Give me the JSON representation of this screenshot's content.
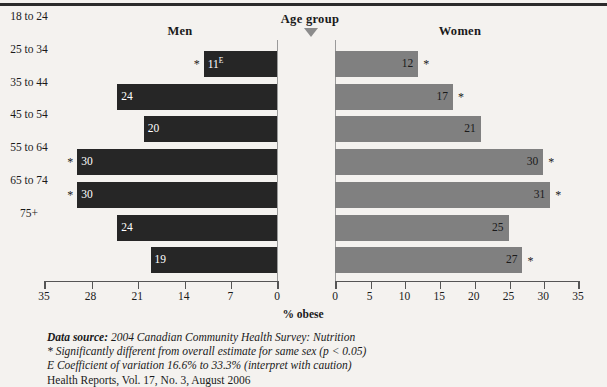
{
  "headers": {
    "men": "Men",
    "women": "Women",
    "age_group": "Age group",
    "arrow_icon": "triangle-down-icon"
  },
  "axis": {
    "title": "% obese",
    "men_ticks": [
      "35",
      "28",
      "21",
      "14",
      "7",
      "0"
    ],
    "women_ticks": [
      "0",
      "5",
      "10",
      "15",
      "20",
      "25",
      "30",
      "35"
    ]
  },
  "notes": [
    {
      "lead": "Data source:",
      "text": " 2004 Canadian Community Health Survey: Nutrition",
      "italic": true
    },
    {
      "lead": "",
      "text": "* Significantly different from overall estimate for same sex (p < 0.05)",
      "italic": true
    },
    {
      "lead": "",
      "text": "E Coefficient of variation 16.6% to 33.3% (interpret with caution)",
      "italic": true
    },
    {
      "lead": "",
      "text": "Health Reports, Vol. 17, No. 3, August 2006",
      "italic": false
    }
  ],
  "colors": {
    "men_bar": "#262626",
    "women_bar": "#808080",
    "background": "#f4f2ef",
    "rule": "#2b2b2b",
    "axis": "#555555"
  },
  "chart_data": {
    "type": "bar",
    "subtype": "back-to-back horizontal bar (population pyramid style)",
    "xlabel": "% obese",
    "ylabel": "Age group",
    "categories": [
      "18 to 24",
      "25 to 34",
      "35 to 44",
      "45 to 54",
      "55 to 64",
      "65 to 74",
      "75+"
    ],
    "men_xlim": [
      35,
      0
    ],
    "women_xlim": [
      0,
      35
    ],
    "grid": false,
    "legend": "none",
    "series": [
      {
        "name": "Men",
        "direction": "left",
        "color": "#262626",
        "values": [
          11,
          24,
          20,
          30,
          30,
          24,
          19
        ],
        "labels": [
          "11",
          "24",
          "20",
          "30",
          "30",
          "24",
          "19"
        ],
        "significant": [
          true,
          false,
          false,
          true,
          true,
          false,
          false
        ],
        "high_cv": [
          true,
          false,
          false,
          false,
          false,
          false,
          false
        ]
      },
      {
        "name": "Women",
        "direction": "right",
        "color": "#808080",
        "values": [
          12,
          17,
          21,
          30,
          31,
          25,
          27
        ],
        "labels": [
          "12",
          "17",
          "21",
          "30",
          "31",
          "25",
          "27"
        ],
        "significant": [
          true,
          true,
          false,
          true,
          true,
          false,
          true
        ],
        "high_cv": [
          false,
          false,
          false,
          false,
          false,
          false,
          false
        ]
      }
    ],
    "annotations": {
      "asterisk": "Significantly different from overall estimate for same sex (p < 0.05)",
      "E": "Coefficient of variation 16.6% to 33.3% (interpret with caution)"
    }
  }
}
